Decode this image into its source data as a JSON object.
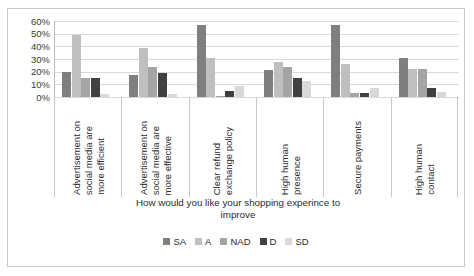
{
  "chart_data": {
    "type": "bar",
    "title": "",
    "xlabel": "How would you like your shopping experince to improve",
    "ylabel": "",
    "ylim": [
      0,
      60
    ],
    "ytick_labels": [
      "60%",
      "50%",
      "40%",
      "30%",
      "20%",
      "10%",
      "0%"
    ],
    "ytick_values": [
      60,
      50,
      40,
      30,
      20,
      10,
      0
    ],
    "grid": true,
    "legend_position": "bottom",
    "categories": [
      "Advertisement on social media are more efficient",
      "Advertisement on social media are more effective",
      "Clear refund exchange policy",
      "High human presence",
      "Secure payments",
      "High human contact"
    ],
    "category_lines": [
      [
        "Advertisement on",
        "social media are",
        "more efficient"
      ],
      [
        "Advertisement on",
        "social media are",
        "more effective"
      ],
      [
        "Clear refund",
        "exchange policy"
      ],
      [
        "High human",
        "presence"
      ],
      [
        "Secure payments"
      ],
      [
        "High human",
        "contact"
      ]
    ],
    "series": [
      {
        "name": "SA",
        "color": "#7f7f7f",
        "values": [
          20,
          17,
          57,
          21,
          57,
          31
        ]
      },
      {
        "name": "A",
        "color": "#bfbfbf",
        "values": [
          49,
          39,
          31,
          28,
          26,
          22
        ]
      },
      {
        "name": "NAD",
        "color": "#a5a5a5",
        "values": [
          15,
          24,
          1,
          24,
          3,
          22
        ]
      },
      {
        "name": "D",
        "color": "#404040",
        "values": [
          15,
          19,
          5,
          15,
          3,
          7
        ]
      },
      {
        "name": "SD",
        "color": "#d9d9d9",
        "values": [
          2,
          2,
          9,
          13,
          7,
          4
        ]
      }
    ]
  },
  "legend": {
    "entries": [
      {
        "label": "SA",
        "color": "#7f7f7f"
      },
      {
        "label": "A",
        "color": "#bfbfbf"
      },
      {
        "label": "NAD",
        "color": "#a5a5a5"
      },
      {
        "label": "D",
        "color": "#404040"
      },
      {
        "label": "SD",
        "color": "#d9d9d9"
      }
    ]
  },
  "axis_title": {
    "line1": "How would you like your shopping experince to",
    "line2": "improve"
  }
}
